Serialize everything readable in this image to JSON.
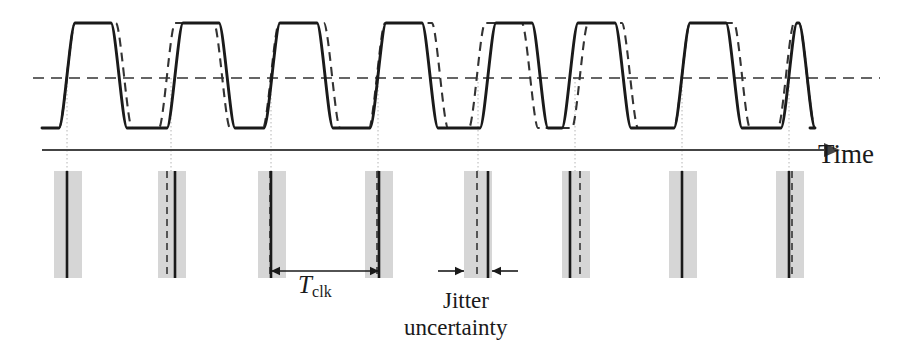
{
  "figure": {
    "background_color": "#ffffff",
    "width": 909,
    "height": 354
  },
  "labels": {
    "time_axis": "Time",
    "period_symbol": "T",
    "period_subscript": "clk",
    "jitter_line1": "Jitter",
    "jitter_line2": "uncertainty"
  },
  "colors": {
    "ink": "#1a1a1a",
    "waveform_solid": "#1a1a1a",
    "waveform_dashed": "#333333",
    "threshold_line": "#333333",
    "axis": "#444444",
    "uncertainty_band": "#cfcfcf",
    "guide_dotted": "#b4b4b4"
  },
  "chart_data": {
    "type": "line",
    "xlabel": "Time",
    "ylabel": "",
    "grid": false,
    "legend_position": "none",
    "axis": {
      "x_start": 42,
      "x_end": 840,
      "y": 150,
      "arrow": true
    },
    "waveform": {
      "high_level": 23,
      "low_level": 128,
      "threshold_level": 78,
      "rise_time": 16,
      "description": "Trapezoidal clock waveform, solid = ideal clock, dashed = jittered clock"
    },
    "threshold": {
      "label": "",
      "y": 78,
      "x_start": 33,
      "x_end": 880,
      "style": "dashed"
    },
    "series": [
      {
        "name": "ideal clock",
        "style": "solid",
        "edges": [
          42,
          67,
          119,
          175,
          227,
          272,
          325,
          378,
          430,
          488,
          540,
          570,
          623,
          682,
          734,
          789,
          807
        ]
      },
      {
        "name": "jittered clock",
        "style": "dashed",
        "edges": [
          42,
          67,
          124,
          167,
          222,
          271,
          332,
          377,
          440,
          477,
          530,
          580,
          630,
          682,
          742,
          786,
          807
        ]
      }
    ],
    "edge_markers": [
      {
        "index": 1,
        "center": 67,
        "band_start": 54,
        "band_end": 82,
        "solid_x": 67,
        "dashed_x": null,
        "guide": true
      },
      {
        "index": 2,
        "center": 171,
        "band_start": 158,
        "band_end": 186,
        "solid_x": 175,
        "dashed_x": 167,
        "guide": true
      },
      {
        "index": 3,
        "center": 271,
        "band_start": 258,
        "band_end": 286,
        "solid_x": 271,
        "dashed_x": 270,
        "guide": true
      },
      {
        "index": 4,
        "center": 378,
        "band_start": 365,
        "band_end": 393,
        "solid_x": 379,
        "dashed_x": 377,
        "guide": true
      },
      {
        "index": 5,
        "center": 478,
        "band_start": 464,
        "band_end": 492,
        "solid_x": 488,
        "dashed_x": 477,
        "guide": true
      },
      {
        "index": 6,
        "center": 575,
        "band_start": 562,
        "band_end": 590,
        "solid_x": 570,
        "dashed_x": 580,
        "guide": true
      },
      {
        "index": 7,
        "center": 682,
        "band_start": 669,
        "band_end": 697,
        "solid_x": 682,
        "dashed_x": null,
        "guide": true
      },
      {
        "index": 8,
        "center": 789,
        "band_start": 776,
        "band_end": 804,
        "solid_x": 789,
        "dashed_x": 792,
        "guide": true
      }
    ],
    "measurements": [
      {
        "name": "clock period",
        "label": "T_clk",
        "from_x": 271,
        "to_x": 379,
        "y": 271,
        "style": "double-arrow"
      },
      {
        "name": "jitter uncertainty",
        "label": "Jitter uncertainty",
        "from_x": 464,
        "to_x": 492,
        "y": 271,
        "style": "inward-arrows"
      }
    ],
    "marker_band": {
      "top": 171,
      "bottom": 278,
      "band_color": "#cfcfcf",
      "note": "Gray vertical bands show the timing uncertainty window around each ideal clock edge"
    }
  }
}
